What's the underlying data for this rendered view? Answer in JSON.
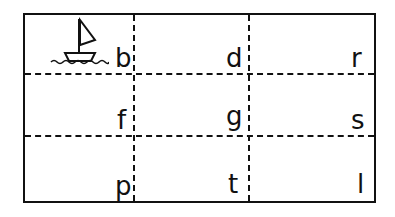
{
  "worksheet": {
    "picture": "sailboat-icon",
    "cells": [
      {
        "row": 0,
        "col": 0,
        "letter": "b"
      },
      {
        "row": 0,
        "col": 1,
        "letter": "d"
      },
      {
        "row": 0,
        "col": 2,
        "letter": "r"
      },
      {
        "row": 1,
        "col": 0,
        "letter": "f"
      },
      {
        "row": 1,
        "col": 1,
        "letter": "g"
      },
      {
        "row": 1,
        "col": 2,
        "letter": "s"
      },
      {
        "row": 2,
        "col": 0,
        "letter": "p"
      },
      {
        "row": 2,
        "col": 1,
        "letter": "t"
      },
      {
        "row": 2,
        "col": 2,
        "letter": "l"
      }
    ]
  }
}
